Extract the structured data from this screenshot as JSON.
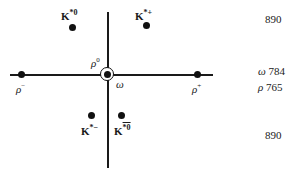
{
  "diagram": {
    "axes": {
      "horizontal": "I3",
      "vertical": "Y"
    },
    "particles": [
      {
        "id": "K*0",
        "symbol": "K",
        "superscript": "*0",
        "dot": [
          72,
          27
        ]
      },
      {
        "id": "K*+",
        "symbol": "K",
        "superscript": "*+",
        "dot": [
          146,
          25
        ]
      },
      {
        "id": "rho-",
        "symbol": "ρ",
        "superscript": "−",
        "dot": [
          21,
          75
        ]
      },
      {
        "id": "rho+",
        "symbol": "ρ",
        "superscript": "+",
        "dot": [
          197,
          75
        ]
      },
      {
        "id": "rho0",
        "symbol": "ρ",
        "superscript": "0",
        "dot": [
          108,
          75
        ]
      },
      {
        "id": "omega",
        "symbol": "ω",
        "superscript": "",
        "dot": [
          108,
          75
        ]
      },
      {
        "id": "K*-",
        "symbol": "K",
        "superscript": "*−",
        "dot": [
          91,
          115
        ]
      },
      {
        "id": "K*0bar",
        "symbol": "K",
        "superscript": "*0",
        "bar": true,
        "dot": [
          121,
          115
        ]
      }
    ],
    "labels": {
      "k_star_0": {
        "base": "K",
        "sup": "*0"
      },
      "k_star_plus": {
        "base": "K",
        "sup": "*+"
      },
      "rho_minus": {
        "base": "ρ",
        "sup": "−"
      },
      "rho_plus": {
        "base": "ρ",
        "sup": "+"
      },
      "rho_zero": {
        "base": "ρ",
        "sup": "0"
      },
      "omega": {
        "base": "ω"
      },
      "k_star_minus": {
        "base": "K",
        "sup": "*−"
      },
      "k_star_0_bar": {
        "base": "K",
        "sup": "*0"
      }
    },
    "masses": [
      {
        "row": "top",
        "symbol": "",
        "value": "890"
      },
      {
        "row": "middle-1",
        "symbol": "ω",
        "value": "784"
      },
      {
        "row": "middle-2",
        "symbol": "ρ",
        "value": "765"
      },
      {
        "row": "bottom",
        "symbol": "",
        "value": "890"
      }
    ]
  }
}
